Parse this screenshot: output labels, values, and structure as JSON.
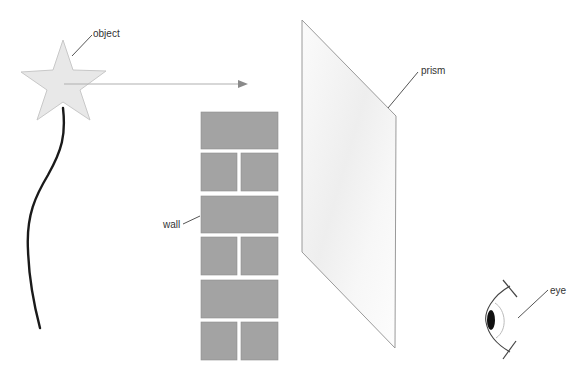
{
  "diagram": {
    "background": "#ffffff",
    "labels": {
      "object": "object",
      "wall": "wall",
      "prism": "prism",
      "eye": "eye"
    },
    "colors": {
      "star_fill": "#e8e8e8",
      "star_stroke": "#c8c8c8",
      "brick_fill": "#a3a3a3",
      "mortar": "#dcdcdc",
      "prism_stroke": "#9a9a9a",
      "prism_fill": "#f6f6f6",
      "ray": "#b0b0b0",
      "stick": "#1a1a1a",
      "pupil": "#111111"
    },
    "elements": [
      {
        "name": "object",
        "shape": "star-on-stick"
      },
      {
        "name": "ray",
        "shape": "arrow",
        "direction": "right"
      },
      {
        "name": "wall",
        "shape": "brick-column",
        "rows": 6
      },
      {
        "name": "prism",
        "shape": "parallelogram"
      },
      {
        "name": "eye",
        "shape": "eye-side-view",
        "facing": "left"
      }
    ]
  }
}
